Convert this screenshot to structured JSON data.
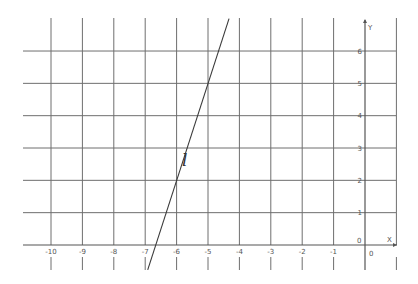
{
  "chart_data": {
    "type": "line",
    "title": "",
    "xlabel": "X",
    "ylabel": "Y",
    "xlim": [
      -11,
      1
    ],
    "ylim": [
      -0.8,
      7
    ],
    "grid": true,
    "x_ticks": [
      "-10",
      "-9",
      "-8",
      "-7",
      "-6",
      "-5",
      "-4",
      "-3",
      "-2",
      "-1",
      "0"
    ],
    "y_ticks": [
      "0",
      "1",
      "2",
      "3",
      "4",
      "5",
      "6"
    ],
    "origin_labels": [
      "0",
      "0"
    ],
    "series": [
      {
        "name": "l",
        "equation": "y = 3x + 20",
        "points": [
          [
            -6.92,
            -0.77
          ],
          [
            -6,
            2
          ],
          [
            -5,
            5
          ],
          [
            -4.33,
            7
          ]
        ]
      }
    ],
    "annotations": [
      {
        "text": "l",
        "x": -5.7,
        "y": 3.5
      }
    ]
  },
  "labels": {
    "line_name": "l",
    "x_axis": "X",
    "y_axis": "Y",
    "origin_x": "0",
    "origin_y": "0"
  },
  "colors": {
    "grid": "#6e6e6e",
    "axis": "#555555",
    "line": "#3a3a3a",
    "background": "#ffffff"
  }
}
